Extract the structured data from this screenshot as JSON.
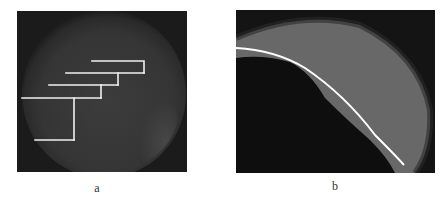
{
  "figure": {
    "panels": [
      {
        "id": "a",
        "label": "a",
        "description": "Dark circular grayscale image with stepped white line overlay",
        "overlay": {
          "type": "stepped-lines",
          "color": "#f2f2f2",
          "segments": [
            [
              [
                92,
                61
              ],
              [
                144,
                61
              ],
              [
                144,
                73
              ]
            ],
            [
              [
                66,
                73
              ],
              [
                144,
                73
              ]
            ],
            [
              [
                118,
                73
              ],
              [
                118,
                85
              ]
            ],
            [
              [
                49,
                85
              ],
              [
                118,
                85
              ]
            ],
            [
              [
                101,
                85
              ],
              [
                101,
                98
              ]
            ],
            [
              [
                22,
                98
              ],
              [
                101,
                98
              ]
            ],
            [
              [
                74,
                98
              ],
              [
                74,
                140
              ]
            ],
            [
              [
                35,
                140
              ],
              [
                74,
                140
              ]
            ]
          ]
        }
      },
      {
        "id": "b",
        "label": "b",
        "description": "Zoomed grayscale crescent region with white curved line overlay",
        "overlay": {
          "type": "curve",
          "color": "#ffffff",
          "points": [
            [
              236,
              48
            ],
            [
              270,
              52
            ],
            [
              300,
              65
            ],
            [
              325,
              80
            ],
            [
              345,
              100
            ],
            [
              365,
              120
            ],
            [
              380,
              140
            ],
            [
              394,
              155
            ],
            [
              404,
              165
            ]
          ]
        }
      }
    ]
  }
}
